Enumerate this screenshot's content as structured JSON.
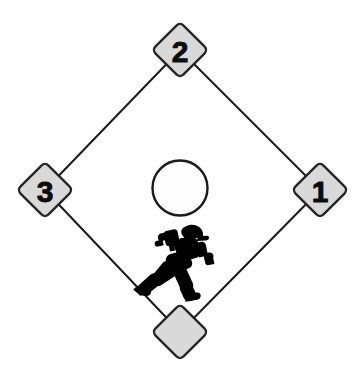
{
  "diagram": {
    "background_color": "#ffffff"
  },
  "colors": {
    "base_fill": "#d9d9d9",
    "base_stroke": "#262626",
    "base_line": "#1a1a1a",
    "mound_fill": "#fdfdfd",
    "mound_stroke": "#1a1a1a",
    "runner_fill": "#000000",
    "label_color": "#0d0d0d"
  },
  "bases": [
    {
      "id": "first-base",
      "label": "1",
      "cx": 320,
      "cy": 190,
      "half": 28,
      "corner_radius": 7
    },
    {
      "id": "second-base",
      "label": "2",
      "cx": 180,
      "cy": 50,
      "half": 28,
      "corner_radius": 7
    },
    {
      "id": "third-base",
      "label": "3",
      "cx": 45,
      "cy": 190,
      "half": 28,
      "corner_radius": 7
    },
    {
      "id": "home-plate",
      "label": "",
      "cx": 180,
      "cy": 332,
      "half": 28,
      "corner_radius": 7
    }
  ],
  "baselines": [
    {
      "id": "home-to-first",
      "x1": 180,
      "y1": 332,
      "x2": 320,
      "y2": 190
    },
    {
      "id": "first-to-second",
      "x1": 320,
      "y1": 190,
      "x2": 180,
      "y2": 50
    },
    {
      "id": "second-to-third",
      "x1": 180,
      "y1": 50,
      "x2": 45,
      "y2": 190
    },
    {
      "id": "third-to-home",
      "x1": 45,
      "y1": 190,
      "x2": 180,
      "y2": 332
    }
  ],
  "pitchers_mound": {
    "id": "pitchers-mound",
    "cx": 180,
    "cy": 188,
    "r": 28
  },
  "runner": {
    "id": "base-runner",
    "description": "sliding base runner silhouette",
    "x": 126,
    "y": 225,
    "width": 86,
    "height": 72
  },
  "line_width": 2
}
